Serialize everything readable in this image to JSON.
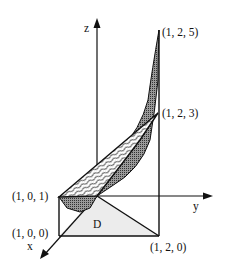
{
  "figure": {
    "type": "3d-region-diagram",
    "axes": {
      "x_label": "x",
      "y_label": "y",
      "z_label": "z"
    },
    "region_label": "D",
    "points": [
      {
        "id": "p101",
        "label": "(1, 0, 1)"
      },
      {
        "id": "p100",
        "label": "(1, 0, 0)"
      },
      {
        "id": "p120",
        "label": "(1, 2, 0)"
      },
      {
        "id": "p123",
        "label": "(1, 2, 3)"
      },
      {
        "id": "p125",
        "label": "(1, 2, 5)"
      }
    ],
    "surfaces": {
      "upper_plane_fill": "wavy-pattern",
      "lower_curved_fill": "dark-stipple",
      "region_fill": "#ececec"
    }
  }
}
